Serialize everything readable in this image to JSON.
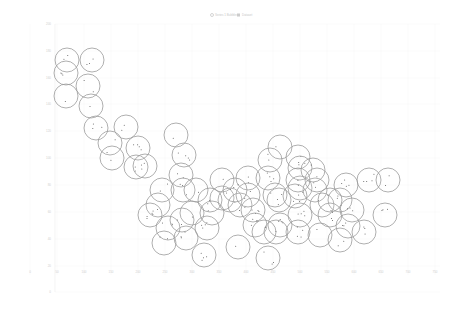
{
  "chart_data": {
    "type": "scatter",
    "subtype": "bubble",
    "title": "",
    "xlabel": "",
    "ylabel": "",
    "legend": {
      "position": "top-center",
      "entries": [
        {
          "label": "Series 1 Bubbles",
          "marker": "circle-dot"
        },
        {
          "label": "Dataset",
          "marker": "square"
        }
      ]
    },
    "xlim": [
      -50,
      750
    ],
    "ylim": [
      -10,
      220
    ],
    "grid": true,
    "x_ticks": [
      "0",
      "50",
      "100",
      "150",
      "200",
      "250",
      "300",
      "350",
      "400",
      "450",
      "500",
      "550",
      "600",
      "650",
      "700",
      "750"
    ],
    "y_ticks": [
      "200",
      "180",
      "160",
      "140",
      "120",
      "100",
      "80",
      "60",
      "40",
      "20",
      "0"
    ],
    "bubble_radius_px": 12,
    "series": [
      {
        "name": "Series 1 Bubbles",
        "points_px": [
          [
            67,
            60
          ],
          [
            92,
            60
          ],
          [
            66,
            73
          ],
          [
            88,
            86
          ],
          [
            66,
            96
          ],
          [
            91,
            106
          ],
          [
            96,
            128
          ],
          [
            126,
            127
          ],
          [
            110,
            143
          ],
          [
            138,
            148
          ],
          [
            112,
            158
          ],
          [
            136,
            167
          ],
          [
            145,
            166
          ],
          [
            176,
            135
          ],
          [
            184,
            155
          ],
          [
            181,
            175
          ],
          [
            162,
            190
          ],
          [
            158,
            205
          ],
          [
            183,
            190
          ],
          [
            196,
            190
          ],
          [
            168,
            228
          ],
          [
            192,
            213
          ],
          [
            207,
            228
          ],
          [
            164,
            243
          ],
          [
            186,
            238
          ],
          [
            204,
            255
          ],
          [
            222,
            198
          ],
          [
            212,
            213
          ],
          [
            222,
            180
          ],
          [
            248,
            178
          ],
          [
            230,
            200
          ],
          [
            240,
            205
          ],
          [
            253,
            210
          ],
          [
            268,
            178
          ],
          [
            279,
            200
          ],
          [
            255,
            225
          ],
          [
            280,
            225
          ],
          [
            300,
            215
          ],
          [
            280,
            147
          ],
          [
            270,
            160
          ],
          [
            298,
            157
          ],
          [
            300,
            168
          ],
          [
            300,
            188
          ],
          [
            315,
            190
          ],
          [
            317,
            180
          ],
          [
            295,
            196
          ],
          [
            322,
            205
          ],
          [
            340,
            200
          ],
          [
            330,
            215
          ],
          [
            352,
            210
          ],
          [
            346,
            185
          ],
          [
            298,
            232
          ],
          [
            320,
            235
          ],
          [
            340,
            240
          ],
          [
            348,
            226
          ],
          [
            364,
            232
          ],
          [
            276,
            232
          ],
          [
            264,
            232
          ],
          [
            238,
            247
          ],
          [
            268,
            258
          ],
          [
            369,
            180
          ],
          [
            388,
            180
          ],
          [
            385,
            215
          ],
          [
            298,
            180
          ],
          [
            313,
            170
          ],
          [
            275,
            195
          ],
          [
            330,
            200
          ],
          [
            210,
            200
          ],
          [
            150,
            215
          ],
          [
            182,
            220
          ],
          [
            248,
            195
          ],
          [
            235,
            190
          ]
        ]
      }
    ]
  },
  "legend": {
    "items": [
      {
        "label": "Series 1 Bubbles"
      },
      {
        "label": "Dataset"
      }
    ]
  }
}
